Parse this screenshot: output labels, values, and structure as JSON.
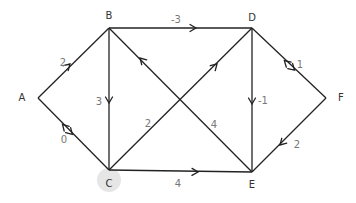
{
  "diagram": {
    "type": "directed-weighted-graph",
    "colors": {
      "edge": "#222222",
      "node_label": "#333333",
      "edge_label": "#777777",
      "highlight": "#e6e6e6",
      "background": "#ffffff"
    },
    "nodes": [
      {
        "id": "A",
        "label": "A",
        "x": 38,
        "y": 98,
        "lx": 22,
        "ly": 101
      },
      {
        "id": "B",
        "label": "B",
        "x": 109,
        "y": 28,
        "lx": 109,
        "ly": 19
      },
      {
        "id": "C",
        "label": "C",
        "x": 109,
        "y": 170,
        "lx": 109,
        "ly": 187,
        "highlighted": true
      },
      {
        "id": "D",
        "label": "D",
        "x": 252,
        "y": 28,
        "lx": 252,
        "ly": 21
      },
      {
        "id": "E",
        "label": "E",
        "x": 252,
        "y": 172,
        "lx": 252,
        "ly": 188
      },
      {
        "id": "F",
        "label": "F",
        "x": 326,
        "y": 98,
        "lx": 341,
        "ly": 101
      }
    ],
    "edges": [
      {
        "id": "A-B",
        "from": "A",
        "to": "B",
        "weight": "2",
        "direction": "forward",
        "ax": 70,
        "ay": 64,
        "wx": 63,
        "wy": 66
      },
      {
        "id": "A-C",
        "from": "A",
        "to": "C",
        "weight": "0",
        "direction": "both",
        "ax": 66,
        "ay": 128,
        "wx": 64,
        "wy": 143
      },
      {
        "id": "B-C",
        "from": "B",
        "to": "C",
        "weight": "3",
        "direction": "forward",
        "ax": 109,
        "ay": 103,
        "wx": 99,
        "wy": 105
      },
      {
        "id": "B-D",
        "from": "B",
        "to": "D",
        "weight": "-3",
        "direction": "forward",
        "ax": 196,
        "ay": 28,
        "wx": 176,
        "wy": 23
      },
      {
        "id": "E-B",
        "from": "E",
        "to": "B",
        "weight": "4",
        "direction": "forward",
        "ax": 140,
        "ay": 58,
        "wx": 214,
        "wy": 128
      },
      {
        "id": "C-D",
        "from": "C",
        "to": "D",
        "weight": "2",
        "direction": "forward",
        "ax": 217,
        "ay": 64,
        "wx": 148,
        "wy": 127
      },
      {
        "id": "C-E",
        "from": "C",
        "to": "E",
        "weight": "4",
        "direction": "forward",
        "ax": 198,
        "ay": 172,
        "wx": 178,
        "wy": 187
      },
      {
        "id": "D-E",
        "from": "D",
        "to": "E",
        "weight": "-1",
        "direction": "forward",
        "ax": 252,
        "ay": 104,
        "wx": 263,
        "wy": 104
      },
      {
        "id": "D-F",
        "from": "D",
        "to": "F",
        "weight": "1",
        "direction": "both",
        "ax": 288,
        "ay": 64,
        "wx": 300,
        "wy": 68
      },
      {
        "id": "F-E",
        "from": "F",
        "to": "E",
        "weight": "2",
        "direction": "forward",
        "ax": 280,
        "ay": 145,
        "wx": 297,
        "wy": 148
      }
    ]
  }
}
